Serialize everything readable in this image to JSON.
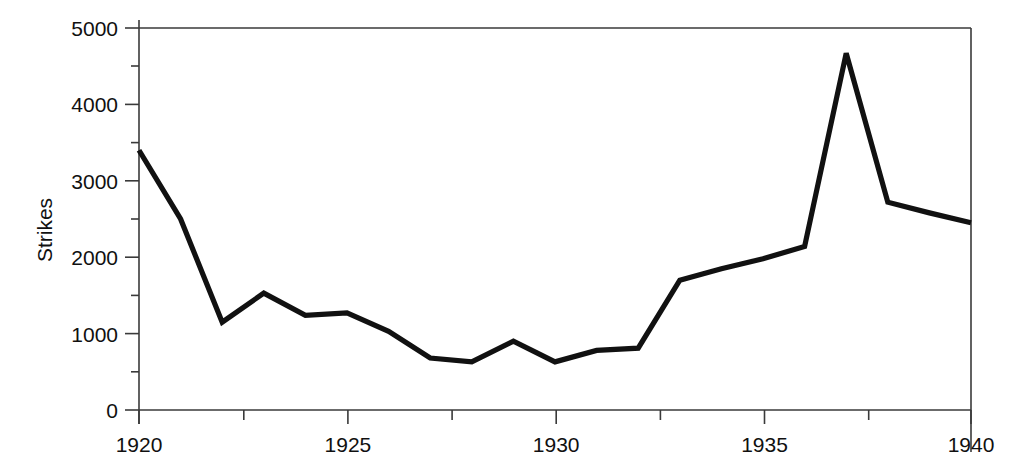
{
  "chart_data": {
    "type": "line",
    "title": "",
    "xlabel": "",
    "ylabel": "Strikes",
    "x": [
      1920,
      1921,
      1922,
      1923,
      1924,
      1925,
      1926,
      1927,
      1928,
      1929,
      1930,
      1931,
      1932,
      1933,
      1934,
      1935,
      1936,
      1937,
      1938,
      1939,
      1940
    ],
    "values": [
      3400,
      2500,
      1150,
      1530,
      1240,
      1270,
      1030,
      680,
      630,
      900,
      630,
      780,
      810,
      1700,
      1850,
      1980,
      2140,
      4670,
      2720,
      2580,
      2450
    ],
    "series": [
      {
        "name": "Strikes",
        "values": [
          3400,
          2500,
          1150,
          1530,
          1240,
          1270,
          1030,
          680,
          630,
          900,
          630,
          780,
          810,
          1700,
          1850,
          1980,
          2140,
          4670,
          2720,
          2580,
          2450
        ]
      }
    ],
    "xlim": [
      1920,
      1940
    ],
    "ylim": [
      0,
      5000
    ],
    "x_major_ticks": [
      1920,
      1925,
      1930,
      1935,
      1940
    ],
    "x_minor_ticks": [
      1922.5,
      1927.5,
      1932.5,
      1937.5
    ],
    "y_major_ticks": [
      0,
      1000,
      2000,
      3000,
      4000,
      5000
    ],
    "y_minor_ticks": [
      500,
      1500,
      2500,
      3500,
      4500
    ],
    "xtick_labels": [
      "1920",
      "1925",
      "1930",
      "1935",
      "1940"
    ],
    "ytick_labels": [
      "0",
      "1000",
      "2000",
      "3000",
      "4000",
      "5000"
    ],
    "grid": false,
    "legend": null,
    "legend_position": "none",
    "line_color": "#111111",
    "axis_color": "#3a3a3a",
    "background_color": "#ffffff"
  },
  "axes": {
    "y_axis_title": "Strikes",
    "x_axis_title": ""
  }
}
